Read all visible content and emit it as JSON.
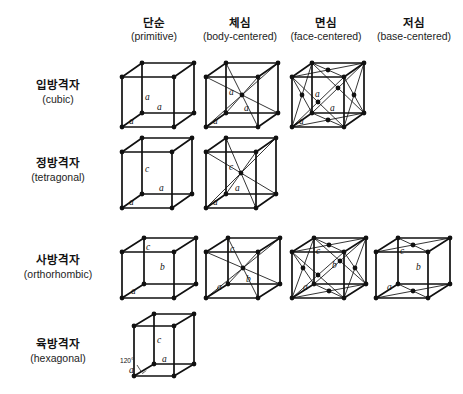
{
  "figure": {
    "title_visible": false,
    "background_color": "#ffffff",
    "line_color": "#111111",
    "node_color": "#111111"
  },
  "columns": [
    {
      "id": "primitive",
      "ko": "단순",
      "en": "(primitive)",
      "x": 112
    },
    {
      "id": "body-centered",
      "ko": "체심",
      "en": "(body-centered)",
      "x": 196
    },
    {
      "id": "face-centered",
      "ko": "면심",
      "en": "(face-centered)",
      "x": 282
    },
    {
      "id": "base-centered",
      "ko": "저심",
      "en": "(base-centered)",
      "x": 366
    }
  ],
  "rows": [
    {
      "id": "cubic",
      "ko": "입방격자",
      "en": "(cubic)",
      "label_y": 78,
      "cells_y": 55
    },
    {
      "id": "tetragonal",
      "ko": "정방격자",
      "en": "(tetragonal)",
      "label_y": 156,
      "cells_y": 132
    },
    {
      "id": "orthorhombic",
      "ko": "사방격자",
      "en": "(orthorhombic)",
      "label_y": 253,
      "cells_y": 228
    },
    {
      "id": "hexagonal",
      "ko": "육방격자",
      "en": "(hexagonal)",
      "label_y": 337,
      "cells_y": 312
    }
  ],
  "cells": {
    "cubic_primitive": {
      "row": "cubic",
      "col": "primitive",
      "labels": [
        "a",
        "a",
        "a"
      ]
    },
    "cubic_body": {
      "row": "cubic",
      "col": "body-centered",
      "labels": [
        "a",
        "a",
        "a"
      ]
    },
    "cubic_face": {
      "row": "cubic",
      "col": "face-centered",
      "labels": [
        "a",
        "a",
        "a"
      ]
    },
    "tetragonal_primitive": {
      "row": "tetragonal",
      "col": "primitive",
      "labels": [
        "c",
        "a",
        "a"
      ]
    },
    "tetragonal_body": {
      "row": "tetragonal",
      "col": "body-centered",
      "labels": [
        "c",
        "a",
        "a"
      ]
    },
    "orthorhombic_primitive": {
      "row": "orthorhombic",
      "col": "primitive",
      "labels": [
        "c",
        "b",
        "a"
      ]
    },
    "orthorhombic_body": {
      "row": "orthorhombic",
      "col": "body-centered",
      "labels": [
        "c",
        "b",
        "a"
      ]
    },
    "orthorhombic_face": {
      "row": "orthorhombic",
      "col": "face-centered",
      "labels": [
        "c",
        "b",
        "a"
      ]
    },
    "orthorhombic_base": {
      "row": "orthorhombic",
      "col": "base-centered",
      "labels": [
        "c",
        "b",
        "a"
      ]
    },
    "hexagonal_primitive": {
      "row": "hexagonal",
      "col": "primitive",
      "labels": [
        "c",
        "a",
        "a"
      ],
      "angle": "120°"
    }
  },
  "labels": {
    "a": "a",
    "b": "b",
    "c": "c",
    "angle120": "120°"
  }
}
